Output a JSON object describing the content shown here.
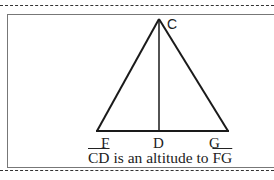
{
  "diagram": {
    "type": "geometry-triangle-altitude",
    "vertices": {
      "apex": "C",
      "base_left": "F",
      "base_foot": "D",
      "base_right": "G"
    },
    "segments": [
      "CF",
      "CG",
      "FG",
      "CD"
    ],
    "caption": {
      "segment": "CD",
      "middle": " is an altitude to ",
      "target": "FG"
    },
    "colors": {
      "line": "#1a1a1a",
      "frame": "#777777",
      "dash": "#333333"
    }
  }
}
